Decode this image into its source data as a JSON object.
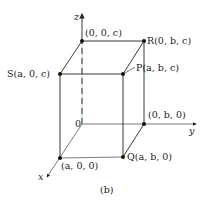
{
  "figure": {
    "caption": "(b)",
    "axes": {
      "x": "x",
      "y": "y",
      "z": "z",
      "origin": "0"
    },
    "points": {
      "zc": "(0, 0, c)",
      "R": "R(0, b, c)",
      "S": "S(a, 0, c)",
      "P": "P(a, b, c)",
      "yb": "(0, b, 0)",
      "Q": "Q(a, b, 0)",
      "xa": "(a, 0, 0)"
    },
    "colors": {
      "line": "#222222",
      "background": "#ffffff"
    }
  }
}
